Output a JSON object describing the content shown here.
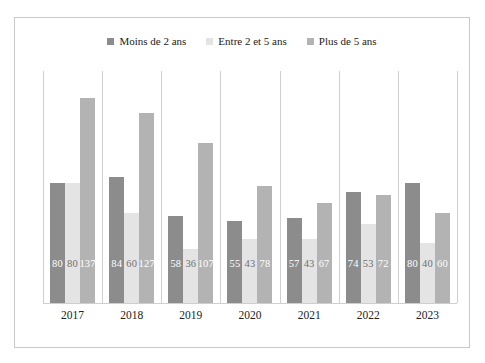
{
  "top_fragment": "",
  "legend": {
    "items": [
      {
        "label": "Moins de 2 ans",
        "color": "#8c8c8c"
      },
      {
        "label": "Entre 2 et 5 ans",
        "color": "#e4e4e4"
      },
      {
        "label": "Plus de 5 ans",
        "color": "#b3b3b3"
      }
    ]
  },
  "chart_data": {
    "type": "bar",
    "title": "",
    "xlabel": "",
    "ylabel": "",
    "categories": [
      "2017",
      "2018",
      "2019",
      "2020",
      "2021",
      "2022",
      "2023"
    ],
    "series": [
      {
        "name": "Moins de 2 ans",
        "color": "#8c8c8c",
        "values": [
          80,
          84,
          58,
          55,
          57,
          74,
          80
        ]
      },
      {
        "name": "Entre 2 et 5 ans",
        "color": "#e4e4e4",
        "values": [
          80,
          60,
          36,
          43,
          43,
          53,
          40
        ]
      },
      {
        "name": "Plus de 5 ans",
        "color": "#b3b3b3",
        "values": [
          137,
          127,
          107,
          78,
          67,
          72,
          60
        ]
      }
    ],
    "ylim": [
      0,
      155
    ],
    "grid": "vertical-group-separators",
    "legend_position": "top-center",
    "data_labels": true
  }
}
